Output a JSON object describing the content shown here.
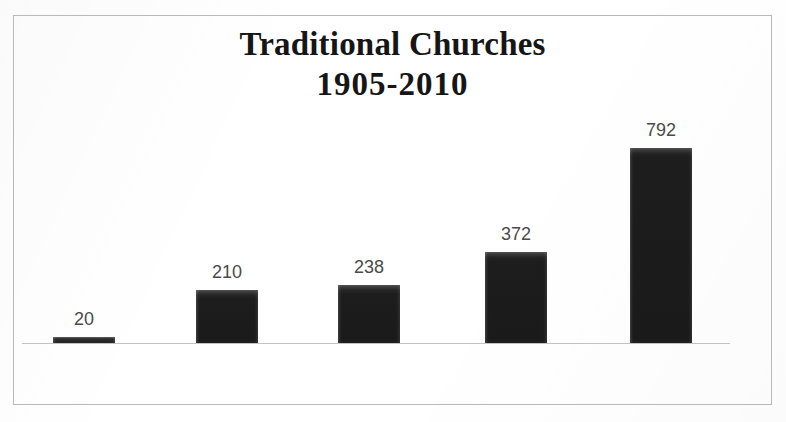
{
  "figure": {
    "width": 786,
    "height": 422,
    "background_color": "#ffffff",
    "border_color": "#b9b9b9"
  },
  "title": {
    "line1": "Traditional Churches",
    "line2": "1905-2010"
  },
  "chart_data": {
    "type": "bar",
    "title": "Traditional Churches 1905-2010",
    "subtitle": "",
    "xlabel": "",
    "ylabel": "",
    "categories": [
      "1905",
      "1960",
      "1990",
      "2000",
      "2010"
    ],
    "values": [
      20,
      210,
      238,
      372,
      792
    ],
    "data_labels": [
      "20",
      "210",
      "238",
      "372",
      "792"
    ],
    "series": [
      {
        "name": "Traditional Churches",
        "values": [
          20,
          210,
          238,
          372,
          792
        ],
        "color": "#1f1f1f"
      }
    ],
    "ylim": [
      0,
      792
    ],
    "grid": false,
    "legend": false,
    "legend_position": "none",
    "axis_line_color": "#c2c2c2",
    "bar_color": "#1f1f1f",
    "label_color": "#4a4a4a",
    "data_label_position": "outside-end",
    "orientation": "vertical"
  },
  "layout": {
    "baseline_y": 343,
    "axis_left": 22,
    "axis_width": 708,
    "bar_width": 62,
    "px_per_unit": 0.2462,
    "bars": [
      {
        "category": "1905",
        "value": 20,
        "left": 53,
        "height": 6,
        "label_bottom": 92
      },
      {
        "category": "1960",
        "value": 210,
        "left": 196,
        "height": 53,
        "label_bottom": 139
      },
      {
        "category": "1990",
        "value": 238,
        "left": 338,
        "height": 58,
        "label_bottom": 144
      },
      {
        "category": "2000",
        "value": 372,
        "left": 485,
        "height": 91,
        "label_bottom": 177
      },
      {
        "category": "2010",
        "value": 792,
        "left": 630,
        "height": 195,
        "label_bottom": 281
      }
    ]
  }
}
